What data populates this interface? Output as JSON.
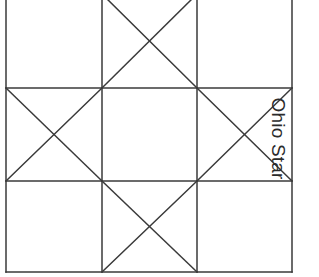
{
  "figure": {
    "title": "Ohio Star",
    "caption_label": "Ohio Star",
    "caption_orientation": "rotated-90-clockwise",
    "background_color": "#ffffff",
    "line_color": "#3a3a3a",
    "line_width": 1.5
  },
  "block": {
    "name": "Ohio Star",
    "grid_rows": 3,
    "grid_columns": 3,
    "left_x": 6,
    "right_x": 292,
    "top_y": -6,
    "bottom_y": 272,
    "column_edges": [
      6,
      102,
      197,
      292
    ],
    "row_edges": [
      -6,
      88,
      181,
      272
    ],
    "top_edge_cropped": true,
    "cells": [
      {
        "row": 0,
        "col": 0,
        "name": "top-left",
        "unit": "plain",
        "diagonals": "none"
      },
      {
        "row": 0,
        "col": 1,
        "name": "top-center",
        "unit": "quarter-square",
        "diagonals": "both"
      },
      {
        "row": 0,
        "col": 2,
        "name": "top-right",
        "unit": "plain",
        "diagonals": "none"
      },
      {
        "row": 1,
        "col": 0,
        "name": "middle-left",
        "unit": "quarter-square",
        "diagonals": "both"
      },
      {
        "row": 1,
        "col": 1,
        "name": "center",
        "unit": "plain",
        "diagonals": "none"
      },
      {
        "row": 1,
        "col": 2,
        "name": "middle-right",
        "unit": "quarter-square",
        "diagonals": "both"
      },
      {
        "row": 2,
        "col": 0,
        "name": "bottom-left",
        "unit": "plain",
        "diagonals": "none"
      },
      {
        "row": 2,
        "col": 1,
        "name": "bottom-center",
        "unit": "quarter-square",
        "diagonals": "both"
      },
      {
        "row": 2,
        "col": 2,
        "name": "bottom-right",
        "unit": "plain",
        "diagonals": "none"
      }
    ]
  }
}
